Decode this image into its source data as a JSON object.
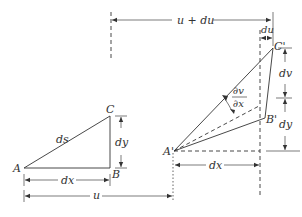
{
  "diagram": {
    "original_element": {
      "points": {
        "A": "A",
        "B": "B",
        "C": "C"
      },
      "hypotenuse_label": "ds",
      "horizontal_label": "dx",
      "vertical_label": "dy"
    },
    "deformed_element": {
      "points": {
        "A": "A'",
        "B": "B'",
        "C": "C'"
      },
      "horizontal_label": "dx",
      "vertical_labels": {
        "upper": "dv",
        "lower": "dy"
      },
      "angle_label": {
        "numerator": "∂v",
        "denominator": "∂x"
      },
      "top_offset_label": "du"
    },
    "dimensions": {
      "displacement_u": "u",
      "displacement_u_plus_du": "u + du"
    }
  }
}
